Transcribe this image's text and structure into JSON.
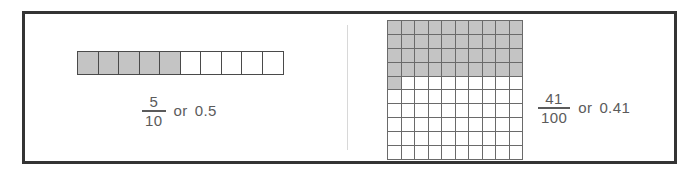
{
  "figure": {
    "border_color": "#343434",
    "divider_color": "#d8d8d8",
    "shade_color": "#c4c4c4",
    "text_color": "#5b5b5b"
  },
  "panels": [
    {
      "id": "tenths",
      "model": "tenths-strip",
      "rows": 1,
      "columns": 10,
      "total_cells": 10,
      "shaded_cells": 5,
      "caption": {
        "numerator": "5",
        "denominator": "10",
        "conjunction": "or",
        "decimal": "0.5"
      }
    },
    {
      "id": "hundredths",
      "model": "hundredths-grid",
      "rows": 10,
      "columns": 10,
      "total_cells": 100,
      "shaded_cells": 41,
      "caption": {
        "numerator": "41",
        "denominator": "100",
        "conjunction": "or",
        "decimal": "0.41"
      }
    }
  ],
  "chart_data": {
    "type": "bar",
    "xlabel": "",
    "ylabel": "",
    "categories": [
      "5/10 or 0.5",
      "41/100 or 0.41"
    ],
    "values": [
      0.5,
      0.41
    ],
    "ylim": [
      0,
      1
    ],
    "grid": true,
    "legend": "none",
    "series": [
      {
        "name": "Shaded fraction of whole",
        "values": [
          0.5,
          0.41
        ]
      }
    ],
    "annotations": [
      "Left model: 1 by 10 strip, 5 of 10 parts shaded",
      "Right model: 10 by 10 grid, 41 of 100 parts shaded (4 full rows plus 1 cell)"
    ]
  }
}
